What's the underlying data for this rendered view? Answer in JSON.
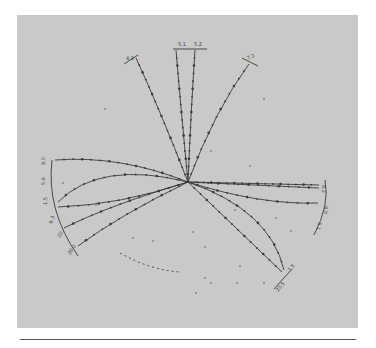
{
  "figure": {
    "colors": {
      "panel": "#c9c9c9",
      "ink": "#3a3a3a",
      "background": "#ffffff"
    }
  },
  "labels": {
    "top_left": "4.8",
    "top_a": "5.1",
    "top_b": "5.2",
    "top_right": "7.2",
    "left_1": "9.0",
    "left_2": "5.6",
    "left_3": "1.5",
    "left_4": "6.3",
    "left_5": "20",
    "left_6": "20.2",
    "right_1": "8.2",
    "right_2": "8.0",
    "right_3": "5.1",
    "bottom_right_1": "7.5",
    "bottom_right_2": "20.5"
  }
}
